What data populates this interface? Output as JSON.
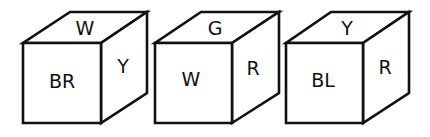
{
  "diagram": {
    "type": "cube-views",
    "cubes": [
      {
        "top": "W",
        "front": "BR",
        "right": "Y"
      },
      {
        "top": "G",
        "front": "W",
        "right": "R"
      },
      {
        "top": "Y",
        "front": "BL",
        "right": "R"
      }
    ]
  }
}
